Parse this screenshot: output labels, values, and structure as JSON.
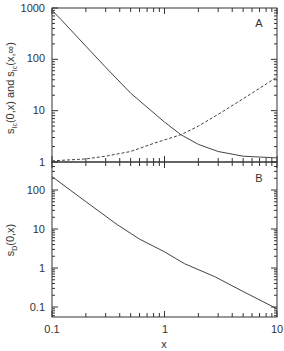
{
  "chart_data": [
    {
      "panel": "A",
      "type": "line",
      "title": "",
      "panel_label": "A",
      "xlabel": "",
      "ylabel": "s_Ic(0,x) and s_Ic(x,∞)",
      "xscale": "log",
      "yscale": "log",
      "xlim": [
        0.1,
        10
      ],
      "ylim": [
        1,
        1000
      ],
      "yticks": [
        "1",
        "10",
        "100",
        "1000"
      ],
      "grid": false,
      "series": [
        {
          "name": "s_Ic(0,x)",
          "style": "solid",
          "x": [
            0.1,
            0.12,
            0.2,
            0.3,
            0.5,
            1.0,
            1.4,
            2.0,
            3.0,
            5.0,
            10.0
          ],
          "values": [
            900,
            600,
            180,
            70,
            22,
            6.0,
            3.4,
            2.2,
            1.6,
            1.3,
            1.2
          ]
        },
        {
          "name": "s_Ic(x,∞)",
          "style": "dashed",
          "x": [
            0.1,
            0.2,
            0.3,
            0.5,
            0.8,
            1.0,
            1.4,
            2.0,
            3.0,
            5.0,
            10.0
          ],
          "values": [
            1.05,
            1.15,
            1.3,
            1.6,
            2.3,
            2.7,
            3.4,
            5.0,
            8.5,
            17,
            45
          ]
        }
      ]
    },
    {
      "panel": "B",
      "type": "line",
      "title": "",
      "panel_label": "B",
      "xlabel": "x",
      "ylabel": "s_D(0,x)",
      "xscale": "log",
      "yscale": "log",
      "xlim": [
        0.1,
        10
      ],
      "ylim": [
        0.06,
        250
      ],
      "xticks": [
        "0.1",
        "1",
        "10"
      ],
      "yticks": [
        "0.1",
        "1",
        "10",
        "100"
      ],
      "grid": false,
      "series": [
        {
          "name": "s_D(0,x)",
          "style": "solid",
          "x": [
            0.1,
            0.2,
            0.38,
            0.6,
            1.0,
            1.5,
            2.8,
            5.0,
            10.0
          ],
          "values": [
            220,
            50,
            13,
            5.5,
            2.6,
            1.3,
            0.6,
            0.25,
            0.09
          ]
        }
      ]
    }
  ],
  "labels": {
    "panelA": "A",
    "panelB": "B",
    "xlabel": "x",
    "ylabelA_main": "s",
    "ylabelA_text": "(0,x) and s",
    "ylabelA_end": "(x,∞)",
    "ylabelA_sub": "Ic",
    "ylabelB_main": "s",
    "ylabelB_sub": "D",
    "ylabelB_end": "(0,x)",
    "yticksA": [
      "1000",
      "100",
      "10",
      "1"
    ],
    "yticksB": [
      "100",
      "10",
      "1",
      "0.1"
    ],
    "xticks": [
      "0.1",
      "1",
      "10"
    ]
  }
}
